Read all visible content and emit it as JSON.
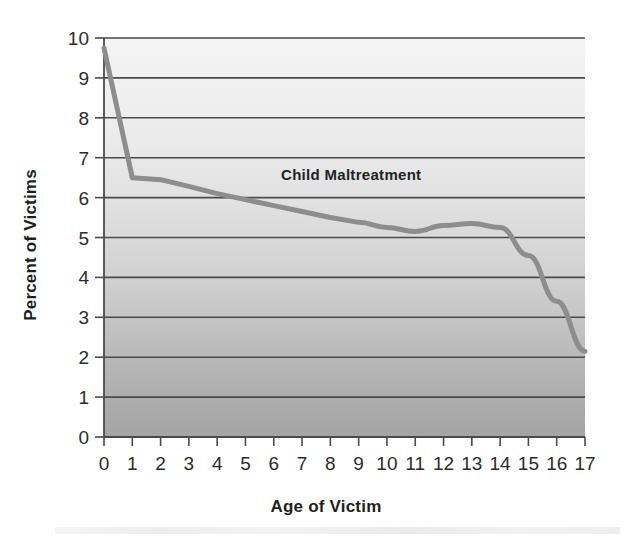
{
  "chart_data": {
    "type": "line",
    "title": "",
    "series_label": "Child Maltreatment",
    "xlabel": "Age of Victim",
    "ylabel": "Percent of Victims",
    "x": [
      0,
      1,
      2,
      3,
      4,
      5,
      6,
      7,
      8,
      9,
      10,
      11,
      12,
      13,
      14,
      15,
      16,
      17
    ],
    "values": [
      9.75,
      6.5,
      6.45,
      6.28,
      6.1,
      5.95,
      5.8,
      5.65,
      5.5,
      5.38,
      5.25,
      5.15,
      5.3,
      5.35,
      5.25,
      4.55,
      3.4,
      2.15
    ],
    "xticklabels": [
      "0",
      "1",
      "2",
      "3",
      "4",
      "5",
      "6",
      "7",
      "8",
      "9",
      "10",
      "11",
      "12",
      "13",
      "14",
      "15",
      "16",
      "17"
    ],
    "yticklabels": [
      "0",
      "1",
      "2",
      "3",
      "4",
      "5",
      "6",
      "7",
      "8",
      "9",
      "10"
    ],
    "yticks": [
      0,
      1,
      2,
      3,
      4,
      5,
      6,
      7,
      8,
      9,
      10
    ],
    "xlim": [
      0,
      17
    ],
    "ylim": [
      0,
      10
    ],
    "grid": true,
    "grid_axis": "y",
    "legend": "inline-label",
    "line_color": "#8d8d8d",
    "grid_color": "#4a4a4a",
    "plot_bg_top_color": "#f2f2f2",
    "plot_bg_bottom_color": "#a6a6a6",
    "text_color": "#2b2b2b"
  }
}
